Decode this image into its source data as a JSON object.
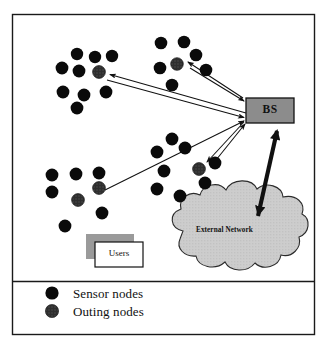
{
  "figure": {
    "background_color": "#ffffff",
    "frame": {
      "border_color": "#1a1a1a",
      "x": 12,
      "y": 14,
      "width": 303,
      "height": 321,
      "divider_y": 281
    }
  },
  "base_station": {
    "label": "BS",
    "fill_color": "#8c8c8c",
    "border_color": "#111111",
    "x": 246,
    "y": 98,
    "width": 48,
    "height": 25
  },
  "external_network": {
    "label": "External Network",
    "fill_color": "#c9c9c9",
    "border_color": "#2b2b2b",
    "label_x": 196,
    "label_y": 231
  },
  "users_box": {
    "label": "Users",
    "fill_color": "#ffffff",
    "shadow_color": "#9a9a9a",
    "border_color": "#111111",
    "x": 95,
    "y": 242,
    "width": 48,
    "height": 25,
    "shadow_offset_x": -9,
    "shadow_offset_y": -8
  },
  "legend": {
    "items": [
      {
        "label": "Sensor nodes",
        "marker": "solid-black-circle",
        "color": "#0a0a0a"
      },
      {
        "label": "Outing nodes",
        "marker": "textured-dark-circle",
        "color": "#2c2c2c"
      }
    ],
    "marker_x": 52,
    "label_x": 73,
    "row1_y": 297,
    "row2_y": 316
  },
  "node_colors": {
    "sensor": "#0a0a0a",
    "outing": "#3a3a3a"
  },
  "clusters": [
    {
      "name": "top-left-cluster",
      "nodes": [
        {
          "cx": 77,
          "cy": 54,
          "r": 6.2,
          "type": "sensor"
        },
        {
          "cx": 95,
          "cy": 57,
          "r": 6.2,
          "type": "sensor"
        },
        {
          "cx": 112,
          "cy": 56,
          "r": 6.2,
          "type": "sensor"
        },
        {
          "cx": 62,
          "cy": 68,
          "r": 6.4,
          "type": "sensor"
        },
        {
          "cx": 79,
          "cy": 71,
          "r": 6.4,
          "type": "sensor"
        },
        {
          "cx": 99,
          "cy": 72,
          "r": 6.4,
          "type": "outing"
        },
        {
          "cx": 63,
          "cy": 92,
          "r": 6.4,
          "type": "sensor"
        },
        {
          "cx": 84,
          "cy": 95,
          "r": 6.4,
          "type": "sensor"
        },
        {
          "cx": 106,
          "cy": 92,
          "r": 6.4,
          "type": "sensor"
        },
        {
          "cx": 77,
          "cy": 108,
          "r": 6.4,
          "type": "sensor"
        }
      ]
    },
    {
      "name": "top-right-cluster",
      "nodes": [
        {
          "cx": 161,
          "cy": 43,
          "r": 6.3,
          "type": "sensor"
        },
        {
          "cx": 184,
          "cy": 42,
          "r": 6.3,
          "type": "sensor"
        },
        {
          "cx": 196,
          "cy": 55,
          "r": 6.3,
          "type": "sensor"
        },
        {
          "cx": 160,
          "cy": 68,
          "r": 6.3,
          "type": "sensor"
        },
        {
          "cx": 177,
          "cy": 64,
          "r": 6.3,
          "type": "outing"
        },
        {
          "cx": 206,
          "cy": 70,
          "r": 6.3,
          "type": "sensor"
        },
        {
          "cx": 172,
          "cy": 85,
          "r": 6.3,
          "type": "sensor"
        }
      ]
    },
    {
      "name": "bottom-left-cluster",
      "nodes": [
        {
          "cx": 52,
          "cy": 175,
          "r": 6.4,
          "type": "sensor"
        },
        {
          "cx": 76,
          "cy": 174,
          "r": 6.4,
          "type": "sensor"
        },
        {
          "cx": 99,
          "cy": 173,
          "r": 6.4,
          "type": "sensor"
        },
        {
          "cx": 52,
          "cy": 192,
          "r": 6.4,
          "type": "sensor"
        },
        {
          "cx": 99,
          "cy": 188,
          "r": 6.4,
          "type": "outing"
        },
        {
          "cx": 78,
          "cy": 200,
          "r": 6.4,
          "type": "outing"
        },
        {
          "cx": 102,
          "cy": 213,
          "r": 6.4,
          "type": "sensor"
        },
        {
          "cx": 65,
          "cy": 226,
          "r": 6.4,
          "type": "sensor"
        }
      ]
    },
    {
      "name": "center-right-cluster",
      "nodes": [
        {
          "cx": 172,
          "cy": 139,
          "r": 6.4,
          "type": "sensor"
        },
        {
          "cx": 157,
          "cy": 152,
          "r": 6.4,
          "type": "sensor"
        },
        {
          "cx": 185,
          "cy": 148,
          "r": 6.4,
          "type": "sensor"
        },
        {
          "cx": 164,
          "cy": 171,
          "r": 6.4,
          "type": "sensor"
        },
        {
          "cx": 199,
          "cy": 169,
          "r": 6.4,
          "type": "outing"
        },
        {
          "cx": 215,
          "cy": 163,
          "r": 6.4,
          "type": "sensor"
        },
        {
          "cx": 205,
          "cy": 183,
          "r": 6.4,
          "type": "sensor"
        },
        {
          "cx": 157,
          "cy": 189,
          "r": 6.4,
          "type": "sensor"
        },
        {
          "cx": 180,
          "cy": 196,
          "r": 6.4,
          "type": "sensor"
        }
      ]
    }
  ],
  "connections": [
    {
      "name": "bs-to-top-left",
      "from_x": 246,
      "from_y": 114,
      "to_x": 106,
      "to_y": 75,
      "style": "thin-arrow"
    },
    {
      "name": "top-left-to-bs",
      "from_x": 108,
      "from_y": 80,
      "to_x": 245,
      "to_y": 117,
      "style": "thin-arrow"
    },
    {
      "name": "bs-to-top-right",
      "from_x": 241,
      "from_y": 97,
      "to_x": 184,
      "to_y": 61,
      "style": "thin-arrow"
    },
    {
      "name": "top-right-to-bs",
      "from_x": 188,
      "from_y": 64,
      "to_x": 245,
      "to_y": 100,
      "style": "thin-arrow"
    },
    {
      "name": "bs-to-center-right",
      "from_x": 243,
      "from_y": 122,
      "to_x": 205,
      "to_y": 163,
      "style": "thin-arrow"
    },
    {
      "name": "center-right-to-bs",
      "from_x": 210,
      "from_y": 161,
      "to_x": 246,
      "to_y": 124,
      "style": "thin-arrow"
    },
    {
      "name": "bottom-left-to-bs",
      "from_x": 106,
      "from_y": 190,
      "to_x": 245,
      "to_y": 122,
      "style": "thin-arrow"
    },
    {
      "name": "bs-to-external-network",
      "from_x": 278,
      "from_y": 133,
      "to_x": 257,
      "to_y": 218,
      "style": "thick-double-arrow"
    }
  ]
}
